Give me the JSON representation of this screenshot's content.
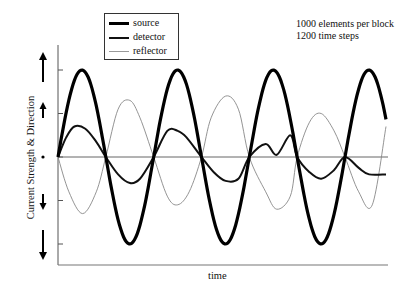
{
  "chart_data": {
    "type": "line",
    "title": "",
    "xlabel": "time",
    "ylabel": "Current Strength & Direction",
    "annotations": [
      "1000 elements per block",
      "1200 time steps"
    ],
    "legend": {
      "position": "top-left inside",
      "entries": [
        {
          "name": "source",
          "style": "thick black"
        },
        {
          "name": "detector",
          "style": "medium black"
        },
        {
          "name": "reflector",
          "style": "thin gray"
        }
      ]
    },
    "y_tick_glyphs": [
      "long up arrow",
      "short up arrow",
      "dot (zero)",
      "short down arrow",
      "long down arrow"
    ],
    "y_ticks": [
      2,
      1,
      0,
      -1,
      -2
    ],
    "ylim": [
      -2.5,
      2.2
    ],
    "xlim": [
      0,
      1200
    ],
    "grid": false,
    "zero_line": true,
    "series": [
      {
        "name": "source",
        "description": "sinusoid, amplitude 2, period ~350 time steps, starts at 0 rising",
        "x": [
          0,
          88,
          175,
          263,
          350,
          438,
          525,
          613,
          700,
          788,
          875,
          963,
          1050,
          1138,
          1200
        ],
        "values": [
          0,
          2,
          0,
          -2,
          0,
          2,
          0,
          -2,
          0,
          2,
          0,
          -2,
          0,
          2,
          -1.8
        ]
      },
      {
        "name": "detector",
        "description": "in phase with source, amplitude ~0.7, noisy",
        "x": [
          0,
          30,
          60,
          100,
          140,
          175,
          220,
          263,
          300,
          350,
          400,
          438,
          470,
          525,
          570,
          613,
          660,
          700,
          760,
          800,
          850,
          875,
          920,
          963,
          1010,
          1050,
          1100,
          1138,
          1200
        ],
        "values": [
          0,
          0.45,
          0.7,
          0.65,
          0.35,
          0,
          -0.4,
          -0.6,
          -0.5,
          0,
          0.6,
          0.6,
          0.45,
          0,
          -0.35,
          -0.55,
          -0.5,
          0,
          0.3,
          0.05,
          0.5,
          0,
          -0.35,
          -0.5,
          -0.3,
          0,
          -0.25,
          -0.4,
          -0.4
        ]
      },
      {
        "name": "reflector",
        "description": "opposite phase to source, amplitude ~1.3",
        "x": [
          0,
          40,
          90,
          140,
          175,
          220,
          263,
          300,
          350,
          400,
          438,
          480,
          525,
          560,
          613,
          660,
          700,
          760,
          800,
          850,
          875,
          920,
          963,
          1010,
          1050,
          1100,
          1150,
          1200
        ],
        "values": [
          0,
          -0.8,
          -1.3,
          -0.8,
          0,
          1.1,
          1.3,
          0.9,
          0,
          -0.9,
          -1.1,
          -0.8,
          0,
          0.9,
          1.4,
          1.1,
          0,
          -0.8,
          -1.2,
          -0.9,
          0,
          0.8,
          1.0,
          0.6,
          0,
          -0.8,
          -1.1,
          0.7
        ]
      }
    ]
  },
  "legend_labels": [
    "source",
    "detector",
    "reflector"
  ],
  "annotation_lines": [
    "1000 elements per block",
    "1200 time steps"
  ],
  "axis_labels": {
    "x": "time",
    "y": "Current Strength & Direction"
  }
}
